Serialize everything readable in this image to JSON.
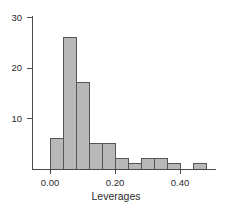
{
  "chart_data": {
    "type": "bar",
    "title": "",
    "subtitle": "",
    "xlabel": "Leverages",
    "ylabel": "",
    "xlim": [
      -0.02,
      0.52
    ],
    "ylim": [
      0,
      31
    ],
    "grid": false,
    "legend": null,
    "bin_width": 0.04,
    "bin_edges": [
      0.0,
      0.04,
      0.08,
      0.12,
      0.16,
      0.2,
      0.24,
      0.28,
      0.32,
      0.36,
      0.4,
      0.44,
      0.48
    ],
    "categories": [
      "0.00-0.04",
      "0.04-0.08",
      "0.08-0.12",
      "0.12-0.16",
      "0.16-0.20",
      "0.20-0.24",
      "0.24-0.28",
      "0.28-0.32",
      "0.32-0.36",
      "0.36-0.40",
      "0.40-0.44",
      "0.44-0.48"
    ],
    "values": [
      6,
      26,
      17,
      5,
      5,
      2,
      1,
      2,
      2,
      1,
      0,
      1
    ],
    "xticks": [
      0.0,
      0.2,
      0.4
    ],
    "xtick_labels": [
      "0.00",
      "0.20",
      "0.40"
    ],
    "yticks": [
      10,
      20,
      30
    ],
    "ytick_labels": [
      "10",
      "20",
      "30"
    ],
    "bar_fill_color": "#b8b8b8",
    "bar_stroke_color": "#555555",
    "axis_color": "#4a4a4a",
    "text_color": "#2b2b2b",
    "background_color": "#ffffff"
  }
}
